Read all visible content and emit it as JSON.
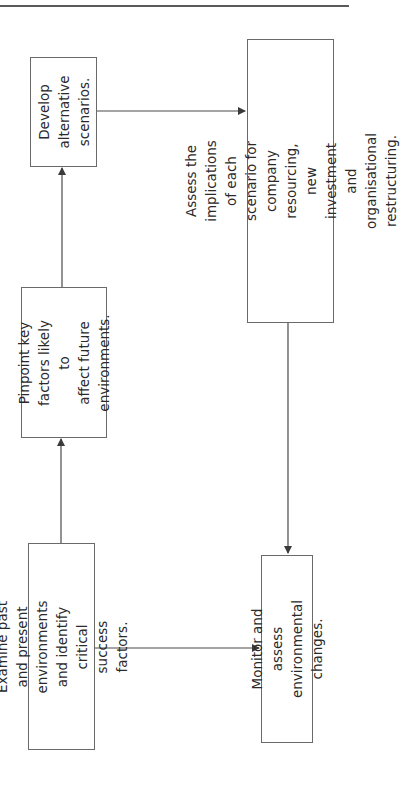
{
  "diagram": {
    "orientation": "rotated-90-ccw",
    "nodes": [
      {
        "id": "examine",
        "text": "Examine past and present\nenvironments and identify\ncritical success factors."
      },
      {
        "id": "pinpoint",
        "text": "Pinpoint key\nfactors likely to\naffect future\nenvironments."
      },
      {
        "id": "develop",
        "text": "Develop\nalternative\nscenarios."
      },
      {
        "id": "assess",
        "text": "Assess the implications of each\nscenario for company resourcing, new\ninvestment and organisational\nrestructuring."
      },
      {
        "id": "monitor",
        "text": "Monitor and assess\nenvironmental changes."
      }
    ],
    "edges": [
      {
        "from": "examine",
        "to": "pinpoint"
      },
      {
        "from": "pinpoint",
        "to": "develop"
      },
      {
        "from": "develop",
        "to": "assess"
      },
      {
        "from": "assess",
        "to": "monitor"
      },
      {
        "from": "examine",
        "to": "monitor"
      }
    ]
  },
  "colors": {
    "line": "#4a4a4a",
    "border": "#6a6a6a",
    "text": "#2a2a2a",
    "background": "#ffffff"
  }
}
